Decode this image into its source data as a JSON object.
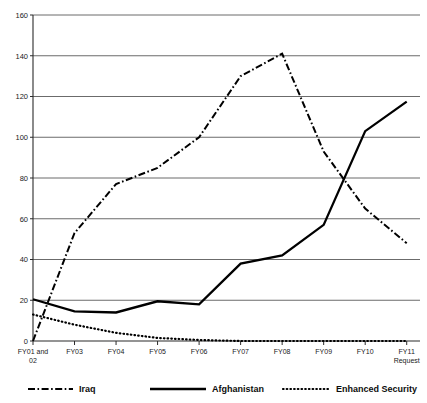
{
  "chart_data": {
    "type": "line",
    "title": "",
    "subtitle": "",
    "xlabel": "",
    "ylabel": "",
    "ylim": [
      0,
      160
    ],
    "yticks": [
      0,
      20,
      40,
      60,
      80,
      100,
      120,
      140,
      160
    ],
    "ytick_labels": [
      "0",
      "20",
      "40",
      "60",
      "80",
      "100",
      "120",
      "140",
      "160"
    ],
    "grid": true,
    "grid_axis": "y",
    "legend_position": "bottom",
    "categories": [
      "FY01 and 02",
      "FY03",
      "FY04",
      "FY05",
      "FY06",
      "FY07",
      "FY08",
      "FY09",
      "FY10",
      "FY11 Request"
    ],
    "xtick_labels": [
      [
        "FY01 and",
        "02"
      ],
      [
        "FY03"
      ],
      [
        "FY04"
      ],
      [
        "FY05"
      ],
      [
        "FY06"
      ],
      [
        "FY07"
      ],
      [
        "FY08"
      ],
      [
        "FY09"
      ],
      [
        "FY10"
      ],
      [
        "FY11",
        "Request"
      ]
    ],
    "series": [
      {
        "name": "Iraq",
        "style": "dash-dot",
        "color": "#000000",
        "values": [
          0,
          53,
          77,
          85,
          100,
          130,
          141,
          93,
          65,
          48
        ]
      },
      {
        "name": "Afghanistan",
        "style": "solid",
        "color": "#000000",
        "values": [
          20.5,
          14.5,
          14,
          19.5,
          18,
          38,
          42,
          57,
          103,
          117.5
        ]
      },
      {
        "name": "Enhanced Security",
        "style": "dotted",
        "color": "#000000",
        "values": [
          13,
          8,
          4,
          1.5,
          0.5,
          0,
          0,
          0,
          0,
          0
        ]
      }
    ]
  },
  "legend": {
    "items": [
      {
        "label": "Iraq",
        "style": "dash-dot"
      },
      {
        "label": "Afghanistan",
        "style": "solid"
      },
      {
        "label": "Enhanced Security",
        "style": "dotted"
      }
    ]
  }
}
